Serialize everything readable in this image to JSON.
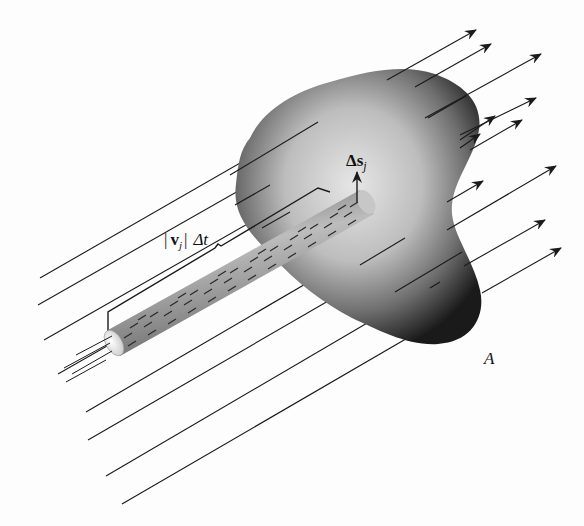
{
  "diagram": {
    "labels": {
      "surface_element": "Δs",
      "surface_element_sub": "j",
      "velocity_label_open": "|",
      "velocity_v": "v",
      "velocity_sub": "j",
      "velocity_label_close": "|",
      "time": "Δt",
      "surface": "A"
    },
    "colors": {
      "line": "#1a1a1a",
      "surface_dark": "#1e1e1e",
      "surface_light": "#d8d8d8",
      "tube": "#8a8a8a",
      "background": "#fdfdfd"
    }
  }
}
